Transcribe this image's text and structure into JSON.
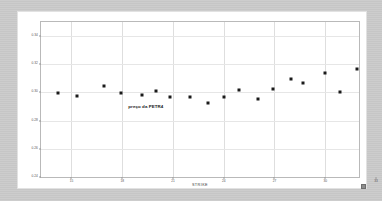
{
  "panel": {
    "background_color": "#ffffff",
    "mount_color": "#c8c8c8"
  },
  "annotation": {
    "text": "preço da PETR4",
    "x_value": 19.4,
    "y_value": 0.2905
  },
  "axis": {
    "x_title": "STRIKE",
    "y_title": "VOLATILIDADE IMPLÍCITA"
  },
  "chart_data": {
    "type": "scatter",
    "title": "",
    "xlabel": "STRIKE",
    "ylabel": "VOLATILIDADE IMPLÍCITA",
    "xlim": [
      13.2,
      32.0
    ],
    "ylim": [
      0.24,
      0.35
    ],
    "grid": true,
    "legend": null,
    "marker": {
      "shape": "square",
      "color": "#1a1a1a",
      "size_px": 3
    },
    "yticks": [
      0.24,
      0.26,
      0.28,
      0.3,
      0.32,
      0.34
    ],
    "ytick_labels": [
      "0.24",
      "0.26",
      "0.28",
      "0.30",
      "0.32",
      "0.34"
    ],
    "xticks": [
      15,
      18,
      21,
      24,
      27,
      30,
      33
    ],
    "xtick_labels": [
      "15",
      "18",
      "21",
      "24",
      "27",
      "30",
      "33"
    ],
    "series": [
      {
        "name": "Volatilidade implícita PETR4",
        "points": [
          {
            "x": 14.2,
            "y": 0.2995
          },
          {
            "x": 15.3,
            "y": 0.2975
          },
          {
            "x": 16.9,
            "y": 0.3045
          },
          {
            "x": 17.9,
            "y": 0.2995
          },
          {
            "x": 19.2,
            "y": 0.2985
          },
          {
            "x": 20.0,
            "y": 0.301
          },
          {
            "x": 20.8,
            "y": 0.2965
          },
          {
            "x": 22.0,
            "y": 0.2965
          },
          {
            "x": 23.1,
            "y": 0.2925
          },
          {
            "x": 24.0,
            "y": 0.297
          },
          {
            "x": 24.9,
            "y": 0.302
          },
          {
            "x": 26.0,
            "y": 0.2955
          },
          {
            "x": 26.9,
            "y": 0.3025
          },
          {
            "x": 28.0,
            "y": 0.3095
          },
          {
            "x": 28.7,
            "y": 0.307
          },
          {
            "x": 30.0,
            "y": 0.314
          },
          {
            "x": 30.9,
            "y": 0.3
          },
          {
            "x": 31.9,
            "y": 0.3165
          },
          {
            "x": 32.8,
            "y": 0.3215
          },
          {
            "x": 33.7,
            "y": 0.3255
          },
          {
            "x": 34.4,
            "y": 0.286
          },
          {
            "x": 35.3,
            "y": 0.3315
          },
          {
            "x": 36.2,
            "y": 0.329
          },
          {
            "x": 38.4,
            "y": 0.3395
          },
          {
            "x": 39.5,
            "y": 0.3385
          }
        ]
      }
    ]
  }
}
